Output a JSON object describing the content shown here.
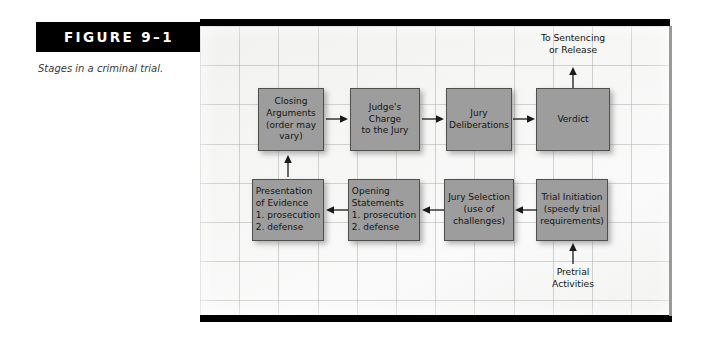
{
  "figure": {
    "label": "FIGURE 9–1",
    "caption": "Stages in a criminal trial."
  },
  "colors": {
    "box_fill": "#9d9d9d",
    "box_border": "#4f4f4f",
    "bar_black": "#000000",
    "panel_bg": "#f6f6f5",
    "grid_line": "#b0b0b0"
  },
  "diagram": {
    "type": "flowchart",
    "title": "Stages in a criminal trial",
    "boxes": [
      {
        "id": "closing-arguments",
        "label": "Closing\nArguments\n(order may\nvary)",
        "row": 1,
        "col": 1
      },
      {
        "id": "judges-charge",
        "label": "Judge's Charge\nto the Jury",
        "row": 1,
        "col": 2
      },
      {
        "id": "jury-deliberations",
        "label": "Jury\nDeliberations",
        "row": 1,
        "col": 3
      },
      {
        "id": "verdict",
        "label": "Verdict",
        "row": 1,
        "col": 4
      },
      {
        "id": "presentation-of-evidence",
        "label": "Presentation\nof Evidence\n1. prosecution\n2. defense",
        "row": 2,
        "col": 1
      },
      {
        "id": "opening-statements",
        "label": "Opening\nStatements\n1. prosecution\n2. defense",
        "row": 2,
        "col": 2
      },
      {
        "id": "jury-selection",
        "label": "Jury Selection\n(use of\nchallenges)",
        "row": 2,
        "col": 3
      },
      {
        "id": "trial-initiation",
        "label": "Trial Initiation\n(speedy trial\nrequirements)",
        "row": 2,
        "col": 4
      }
    ],
    "notes": [
      {
        "id": "to-sentencing-or-release",
        "label": "To Sentencing\nor Release"
      },
      {
        "id": "pretrial-activities",
        "label": "Pretrial\nActivities"
      }
    ],
    "connections": [
      {
        "from": "pretrial-activities",
        "to": "trial-initiation",
        "direction": "up"
      },
      {
        "from": "trial-initiation",
        "to": "jury-selection",
        "direction": "left"
      },
      {
        "from": "jury-selection",
        "to": "opening-statements",
        "direction": "left"
      },
      {
        "from": "opening-statements",
        "to": "presentation-of-evidence",
        "direction": "left"
      },
      {
        "from": "presentation-of-evidence",
        "to": "closing-arguments",
        "direction": "up"
      },
      {
        "from": "closing-arguments",
        "to": "judges-charge",
        "direction": "right"
      },
      {
        "from": "judges-charge",
        "to": "jury-deliberations",
        "direction": "right"
      },
      {
        "from": "jury-deliberations",
        "to": "verdict",
        "direction": "right"
      },
      {
        "from": "verdict",
        "to": "to-sentencing-or-release",
        "direction": "up"
      }
    ]
  }
}
